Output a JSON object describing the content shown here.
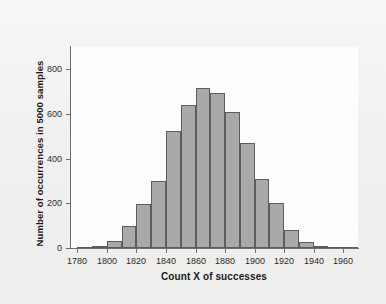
{
  "chart_data": {
    "type": "bar",
    "title": "",
    "subtitle": "",
    "xlabel": "Count X of successes",
    "ylabel": "Number of occurrences in 5000 samples",
    "xlim": [
      1775,
      1970
    ],
    "ylim": [
      0,
      900
    ],
    "grid": false,
    "legend": null,
    "bin_width": 10,
    "bin_starts": [
      1780,
      1790,
      1800,
      1810,
      1820,
      1830,
      1840,
      1850,
      1860,
      1870,
      1880,
      1890,
      1900,
      1910,
      1920,
      1930,
      1940,
      1950,
      1960
    ],
    "categories": [
      "1780-1790",
      "1790-1800",
      "1800-1810",
      "1810-1820",
      "1820-1830",
      "1830-1840",
      "1840-1850",
      "1850-1860",
      "1860-1870",
      "1870-1880",
      "1880-1890",
      "1890-1900",
      "1900-1910",
      "1910-1920",
      "1920-1930",
      "1930-1940",
      "1940-1950",
      "1950-1960",
      "1960-1970"
    ],
    "values": [
      5,
      10,
      30,
      100,
      195,
      300,
      525,
      640,
      715,
      695,
      610,
      470,
      310,
      200,
      80,
      25,
      10,
      3,
      1
    ],
    "yticks": [
      0,
      200,
      400,
      600,
      800
    ],
    "ytick_labels": [
      "0",
      "200",
      "400",
      "600",
      "800"
    ],
    "xticks": [
      1780,
      1800,
      1820,
      1840,
      1860,
      1880,
      1900,
      1920,
      1940,
      1960
    ],
    "xtick_labels": [
      "1780",
      "1800",
      "1820",
      "1840",
      "1860",
      "1880",
      "1900",
      "1920",
      "1940",
      "1960"
    ],
    "bar_fill_color": "#a9a9a9",
    "bar_edge_color": "#5d5d5d",
    "plot_background_color": "#fdfdfc",
    "page_background_color": "#f1f1ef",
    "axis_color": "#6d6d6d"
  }
}
